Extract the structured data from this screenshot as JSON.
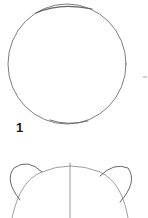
{
  "tutorial": {
    "subject": "bear head drawing steps",
    "steps": [
      {
        "number": "1",
        "description": "circle outline"
      },
      {
        "number": "",
        "description": "ears and center guideline added to head outline"
      }
    ]
  },
  "colors": {
    "background": "#ffffff",
    "pencil_stroke": "#555555",
    "label": "#1a1a1a"
  }
}
